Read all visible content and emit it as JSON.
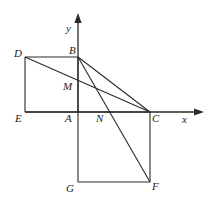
{
  "figure": {
    "stroke_color": "#2b2b2b",
    "label_color": "#1c1c1c",
    "background_color": "#ffffff",
    "axes": {
      "x_label": "x",
      "y_label": "y",
      "origin_label": "A"
    },
    "points": {
      "D": {
        "label": "D",
        "x": 25,
        "y": 57
      },
      "B": {
        "label": "B",
        "x": 78,
        "y": 57
      },
      "E": {
        "label": "E",
        "x": 25,
        "y": 112
      },
      "A": {
        "label": "A",
        "x": 78,
        "y": 112
      },
      "M": {
        "label": "M",
        "x": 78,
        "y": 88
      },
      "N": {
        "label": "N",
        "x": 102,
        "y": 112
      },
      "C": {
        "label": "C",
        "x": 150,
        "y": 112
      },
      "G": {
        "label": "G",
        "x": 78,
        "y": 182
      },
      "F": {
        "label": "F",
        "x": 150,
        "y": 182
      }
    },
    "segments": [
      {
        "name": "segment-DB",
        "from": "D",
        "to": "B"
      },
      {
        "name": "segment-DE",
        "from": "D",
        "to": "E"
      },
      {
        "name": "segment-EA",
        "from": "E",
        "to": "A"
      },
      {
        "name": "segment-BA",
        "from": "B",
        "to": "A"
      },
      {
        "name": "segment-DC",
        "from": "D",
        "to": "C"
      },
      {
        "name": "segment-BC",
        "from": "B",
        "to": "C"
      },
      {
        "name": "segment-BF",
        "from": "B",
        "to": "F"
      },
      {
        "name": "segment-AC",
        "from": "A",
        "to": "C"
      },
      {
        "name": "segment-CF",
        "from": "C",
        "to": "F"
      },
      {
        "name": "segment-FG",
        "from": "F",
        "to": "G"
      },
      {
        "name": "segment-GA",
        "from": "G",
        "to": "A"
      }
    ]
  }
}
